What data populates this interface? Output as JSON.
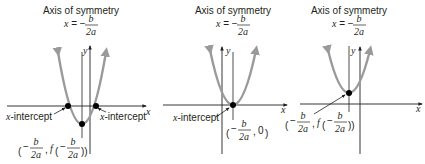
{
  "colors": {
    "curve": "#9a9a9a",
    "axis": "#231f20",
    "point": "#000000",
    "background": "#ffffff"
  },
  "graphs": [
    {
      "id": "a",
      "title": "Axis of symmetry",
      "equation_lhs": "x = −",
      "equation_num": "b",
      "equation_den": "2a",
      "x_axis_label": "x",
      "y_axis_label": "y",
      "point_labels": {
        "left_intercept": "x-intercept",
        "right_intercept": "x-intercept",
        "vertex": "(−b/2a, f(−b/2a))"
      },
      "description": "Parabola opening up, vertex below x-axis, two x-intercepts"
    },
    {
      "id": "b",
      "title": "Axis of symmetry",
      "equation_lhs": "x = −",
      "equation_num": "b",
      "equation_den": "2a",
      "x_axis_label": "x",
      "y_axis_label": "y",
      "point_labels": {
        "intercept": "x-intercept",
        "vertex": "(−b/2a, 0)"
      },
      "description": "Parabola opening up, vertex on x-axis, one x-intercept"
    },
    {
      "id": "c",
      "title": "Axis of symmetry",
      "equation_lhs": "x = −",
      "equation_num": "b",
      "equation_den": "2a",
      "x_axis_label": "x",
      "y_axis_label": "y",
      "point_labels": {
        "vertex": "(−b/2a, f(−b/2a))"
      },
      "description": "Parabola opening up, vertex above x-axis, no x-intercepts"
    }
  ],
  "fraction": {
    "num": "b",
    "den": "2a",
    "neg": "−",
    "f": "f",
    "zero": "0",
    "comma": ","
  },
  "labels": {
    "x_intercept": "-intercept",
    "x_letter": "x"
  }
}
